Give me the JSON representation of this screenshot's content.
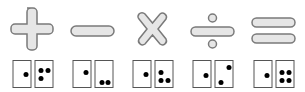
{
  "symbol_fill": "#e6e6e6",
  "symbol_stroke": "#7a7a7a",
  "items": [
    {
      "symbol": "plus-icon",
      "operation": "addition",
      "domino": {
        "left": 1,
        "right": 3
      }
    },
    {
      "symbol": "minus-icon",
      "operation": "subtraction",
      "domino": {
        "left": 1,
        "right": 2
      }
    },
    {
      "symbol": "times-icon",
      "operation": "multiplication",
      "domino": {
        "left": 1,
        "right": 3
      }
    },
    {
      "symbol": "divide-icon",
      "operation": "division",
      "domino": {
        "left": 1,
        "right": 2
      }
    },
    {
      "symbol": "equals-icon",
      "operation": "equality",
      "domino": {
        "left": 1,
        "right": 4
      }
    }
  ]
}
